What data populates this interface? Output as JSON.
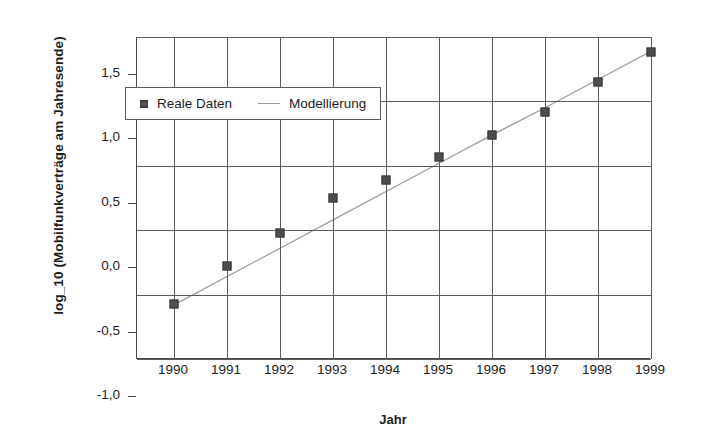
{
  "chart_data": {
    "type": "scatter",
    "title": "",
    "xlabel": "Jahr",
    "ylabel": "log_10 (Mobilfunkverträge am Jahresende)",
    "categories": [
      "1990",
      "1991",
      "1992",
      "1993",
      "1994",
      "1995",
      "1996",
      "1997",
      "1998",
      "1999"
    ],
    "x": [
      1990,
      1991,
      1992,
      1993,
      1994,
      1995,
      1996,
      1997,
      1998,
      1999
    ],
    "xlim": [
      1989.3,
      1999.0
    ],
    "ylim": [
      -1.0,
      1.5
    ],
    "yticks": [
      "-1,0",
      "-0,5",
      "0,0",
      "0,5",
      "1,0",
      "1,5"
    ],
    "ytick_values": [
      -1.0,
      -0.5,
      0.0,
      0.5,
      1.0,
      1.5
    ],
    "grid": true,
    "legend_position": "upper-left-inside",
    "series": [
      {
        "name": "Reale Daten",
        "style": "markers",
        "marker": "square",
        "color": "#4d4d4d",
        "values": [
          -0.57,
          -0.28,
          -0.02,
          0.25,
          0.39,
          0.57,
          0.74,
          0.92,
          1.15,
          1.38
        ]
      },
      {
        "name": "Modellierung",
        "style": "line",
        "color": "#9b9b9b",
        "values": [
          -0.58,
          -0.36,
          -0.14,
          0.08,
          0.3,
          0.52,
          0.74,
          0.95,
          1.17,
          1.39
        ]
      }
    ]
  },
  "axis": {
    "ylabel": "log_10 (Mobilfunkverträge am Jahresende)",
    "xlabel": "Jahr"
  },
  "legend": {
    "items": [
      {
        "label": "Reale Daten",
        "marker": "square-marker-icon"
      },
      {
        "label": "Modellierung",
        "marker": "line-marker-icon"
      }
    ]
  }
}
